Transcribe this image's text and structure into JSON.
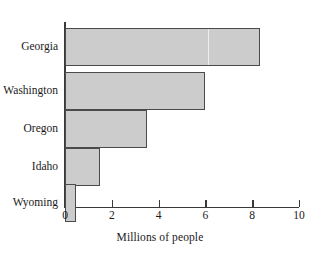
{
  "chart_data": {
    "type": "bar",
    "orientation": "horizontal",
    "title": "",
    "xlabel": "Millions of people",
    "ylabel": "",
    "categories": [
      "Georgia",
      "Washington",
      "Oregon",
      "Idaho",
      "Wyoming"
    ],
    "values": [
      8.35,
      6.0,
      3.5,
      1.5,
      0.45
    ],
    "xlim": [
      0,
      10
    ],
    "xticks": [
      0,
      2,
      4,
      6,
      8,
      10
    ],
    "xtick_labels": [
      "0",
      "2",
      "4",
      "6",
      "8",
      "10"
    ],
    "grid": false,
    "legend": false,
    "bar_fill_color": "#cccccc",
    "bar_edge_color": "#4a4a4a",
    "axis_color": "#3a3a3a",
    "background_color": "#ffffff"
  },
  "axis": {
    "x_title": "Millions of people"
  },
  "bars": [
    {
      "label": "Georgia",
      "value": 8.35
    },
    {
      "label": "Washington",
      "value": 6.0
    },
    {
      "label": "Oregon",
      "value": 3.5
    },
    {
      "label": "Idaho",
      "value": 1.5
    },
    {
      "label": "Wyoming",
      "value": 0.45
    }
  ],
  "ticks": [
    {
      "label": "0",
      "value": 0
    },
    {
      "label": "2",
      "value": 2
    },
    {
      "label": "4",
      "value": 4
    },
    {
      "label": "6",
      "value": 6
    },
    {
      "label": "8",
      "value": 8
    },
    {
      "label": "10",
      "value": 10
    }
  ]
}
